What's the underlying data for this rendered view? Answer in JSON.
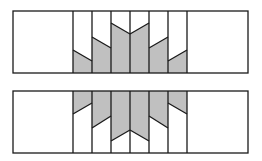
{
  "figure": {
    "width": 262,
    "height": 161,
    "colors": {
      "stroke": "#1a1a1a",
      "fill_shaded": "#c0c0c0",
      "fill_blank": "#ffffff"
    },
    "panels": [
      {
        "name": "top-panel",
        "x": 13,
        "y": 11,
        "w": 235,
        "h": 62,
        "shaded": "below",
        "dividers": [
          73,
          92,
          111,
          130,
          149,
          168,
          187
        ],
        "cuts": [
          {
            "x1": 73,
            "y1": 50,
            "x2": 92,
            "y2": 61
          },
          {
            "x1": 92,
            "y1": 37,
            "x2": 111,
            "y2": 48
          },
          {
            "x1": 111,
            "y1": 23,
            "x2": 130,
            "y2": 34
          },
          {
            "x1": 130,
            "y1": 34,
            "x2": 149,
            "y2": 23
          },
          {
            "x1": 149,
            "y1": 48,
            "x2": 168,
            "y2": 37
          },
          {
            "x1": 168,
            "y1": 61,
            "x2": 187,
            "y2": 50
          }
        ]
      },
      {
        "name": "bottom-panel",
        "x": 13,
        "y": 91,
        "w": 235,
        "h": 62,
        "shaded": "above",
        "dividers": [
          73,
          92,
          111,
          130,
          149,
          168,
          187
        ],
        "cuts": [
          {
            "x1": 73,
            "y1": 114,
            "x2": 92,
            "y2": 103
          },
          {
            "x1": 92,
            "y1": 128,
            "x2": 111,
            "y2": 116
          },
          {
            "x1": 111,
            "y1": 141,
            "x2": 130,
            "y2": 130
          },
          {
            "x1": 130,
            "y1": 130,
            "x2": 149,
            "y2": 141
          },
          {
            "x1": 149,
            "y1": 116,
            "x2": 168,
            "y2": 128
          },
          {
            "x1": 168,
            "y1": 103,
            "x2": 187,
            "y2": 114
          }
        ]
      }
    ]
  }
}
